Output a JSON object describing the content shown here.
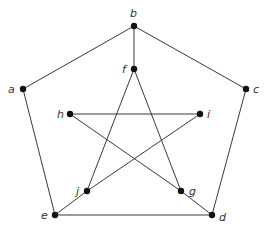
{
  "graph": {
    "nodes": [
      {
        "id": "a",
        "label": "a",
        "x": 23,
        "y": 89,
        "lx": 8,
        "ly": 93
      },
      {
        "id": "b",
        "label": "b",
        "x": 134,
        "y": 26,
        "lx": 130,
        "ly": 17
      },
      {
        "id": "c",
        "label": "c",
        "x": 246,
        "y": 89,
        "lx": 253,
        "ly": 93
      },
      {
        "id": "d",
        "label": "d",
        "x": 212,
        "y": 215,
        "lx": 219,
        "ly": 221
      },
      {
        "id": "e",
        "label": "e",
        "x": 55,
        "y": 215,
        "lx": 41,
        "ly": 219
      },
      {
        "id": "f",
        "label": "f",
        "x": 134,
        "y": 69,
        "lx": 122,
        "ly": 73
      },
      {
        "id": "g",
        "label": "g",
        "x": 181,
        "y": 191,
        "lx": 189,
        "ly": 195
      },
      {
        "id": "h",
        "label": "h",
        "x": 70,
        "y": 114,
        "lx": 57,
        "ly": 118
      },
      {
        "id": "i",
        "label": "i",
        "x": 200,
        "y": 114,
        "lx": 207,
        "ly": 118
      },
      {
        "id": "j",
        "label": "j",
        "x": 87,
        "y": 191,
        "lx": 76,
        "ly": 195
      }
    ],
    "edges": [
      [
        "a",
        "b"
      ],
      [
        "b",
        "c"
      ],
      [
        "c",
        "d"
      ],
      [
        "d",
        "e"
      ],
      [
        "e",
        "a"
      ],
      [
        "b",
        "f"
      ],
      [
        "f",
        "j"
      ],
      [
        "f",
        "g"
      ],
      [
        "h",
        "i"
      ],
      [
        "h",
        "g"
      ],
      [
        "i",
        "j"
      ],
      [
        "j",
        "e"
      ],
      [
        "g",
        "d"
      ]
    ]
  }
}
